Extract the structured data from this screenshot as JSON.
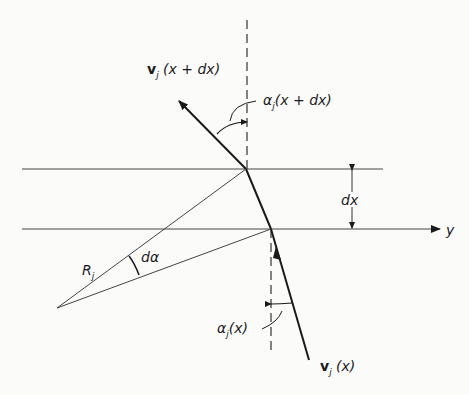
{
  "diagram": {
    "labels": {
      "v_top": {
        "vec": "v",
        "sub": "j",
        "arg": " (x + dx)"
      },
      "alpha_top": {
        "sym": "α",
        "sub": "j",
        "arg": "(x + dx)"
      },
      "dx": "dx",
      "y_axis": "y",
      "R": {
        "sym": "R",
        "sub": "j"
      },
      "dalpha": "dα",
      "alpha_bottom": {
        "sym": "α",
        "sub": "j",
        "arg": "(x)"
      },
      "v_bottom": {
        "vec": "v",
        "sub": "j",
        "arg": " (x)"
      }
    },
    "colors": {
      "ink": "#1a1a1a",
      "thin": "#444444",
      "background": "#fbfbfa"
    }
  }
}
